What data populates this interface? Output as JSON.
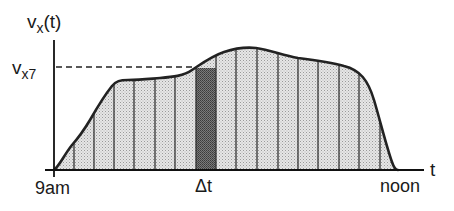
{
  "diagram": {
    "y_axis_label": "v",
    "y_axis_label_sub": "x",
    "y_axis_label_suffix": "(t)",
    "y_marker_label": "v",
    "y_marker_label_sub": "x7",
    "x_axis_label": "t",
    "x_start_label": "9am",
    "x_end_label": "noon",
    "interval_label": "Δt",
    "colors": {
      "curve": "#222222",
      "fill": "#d9d9d9",
      "highlight": "#6a6a6a",
      "axis": "#111111"
    }
  }
}
